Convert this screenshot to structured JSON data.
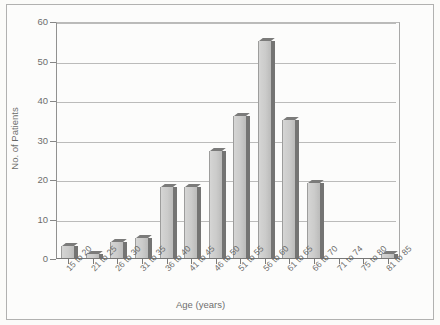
{
  "chart_data": {
    "type": "bar",
    "title": "",
    "xlabel": "Age (years)",
    "ylabel": "No. of Patients",
    "categories": [
      "15 to 20",
      "21 to 25",
      "26 to 30",
      "31 to 35",
      "36 to 40",
      "41 to 45",
      "46 to 50",
      "51 to 55",
      "56 to 60",
      "61 to 65",
      "66 to 70",
      "71 to 74",
      "75 to 80",
      "81 to 85"
    ],
    "values": [
      3,
      1,
      4,
      5,
      18,
      18,
      27,
      36,
      55,
      35,
      19,
      0,
      0,
      1
    ],
    "ylim": [
      0,
      60
    ],
    "ytick_labels": [
      "0",
      "10",
      "20",
      "30",
      "40",
      "50",
      "60"
    ],
    "ytick_values": [
      0,
      10,
      20,
      30,
      40,
      50,
      60
    ],
    "grid": "horizontal",
    "legend": "none",
    "bar_color": "#b4b4b4",
    "bar_edge_color": "#2f2f2f",
    "axis_color": "#333333",
    "grid_color": "#9b9b9b",
    "style": "3d-column"
  }
}
